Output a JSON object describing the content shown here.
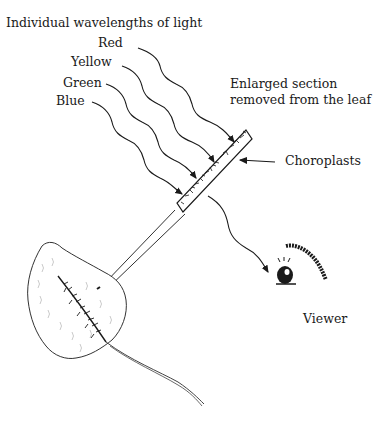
{
  "diagram": {
    "title": "Individual wavelengths of light",
    "wavelengths": [
      {
        "label": "Red"
      },
      {
        "label": "Yellow"
      },
      {
        "label": "Green"
      },
      {
        "label": "Blue"
      }
    ],
    "section_label_line1": "Enlarged section",
    "section_label_line2": "removed from the leaf",
    "chloroplast_label": "Choroplasts",
    "viewer_label": "Viewer",
    "colors": {
      "ink": "#1a1a1a",
      "background": "#ffffff"
    }
  }
}
